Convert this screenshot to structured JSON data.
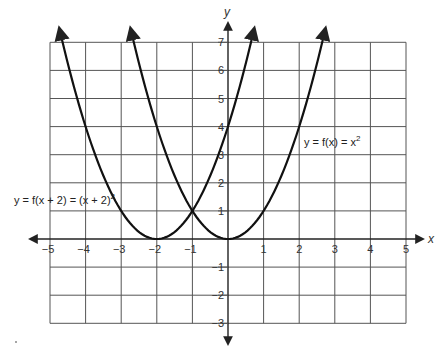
{
  "chart_data": {
    "type": "line",
    "title": "",
    "xlabel": "x",
    "ylabel": "y",
    "xlim": [
      -5,
      5
    ],
    "ylim": [
      -3,
      7
    ],
    "grid": true,
    "x_ticks": [
      -5,
      -4,
      -3,
      -2,
      -1,
      1,
      2,
      3,
      4,
      5
    ],
    "y_ticks": [
      7,
      6,
      5,
      4,
      3,
      2,
      1,
      -1,
      -2,
      -3
    ],
    "series": [
      {
        "name": "y = f(x) = x^2",
        "label_parts": {
          "lhs": "y = f(x) = x",
          "exp": "2"
        },
        "formula": "x^2",
        "h": 0,
        "x": [
          -2.74,
          -2,
          -1,
          0,
          1,
          2,
          2.74
        ],
        "y": [
          7.5,
          4,
          1,
          0,
          1,
          4,
          7.5
        ],
        "vertex": [
          0,
          0
        ]
      },
      {
        "name": "y = f(x + 2) = (x + 2)^2",
        "label_parts": {
          "lhs": "y = f(x + 2) = (x + 2)",
          "exp": "2"
        },
        "formula": "(x+2)^2",
        "h": -2,
        "x": [
          -4.74,
          -4,
          -3,
          -2,
          -1,
          0,
          0.74
        ],
        "y": [
          7.5,
          4,
          1,
          0,
          1,
          4,
          7.5
        ],
        "vertex": [
          -2,
          0
        ]
      }
    ],
    "annotations": [
      {
        "text": "y = f(x) = x^2",
        "near": [
          2.1,
          3.6
        ]
      },
      {
        "text": "y = f(x + 2) = (x + 2)^2",
        "near": [
          -5.9,
          1.5
        ]
      }
    ],
    "intersection": [
      -1,
      1
    ]
  },
  "colors": {
    "grid": "#555555",
    "axis": "#222222",
    "curve": "#111111",
    "text": "#333333"
  }
}
